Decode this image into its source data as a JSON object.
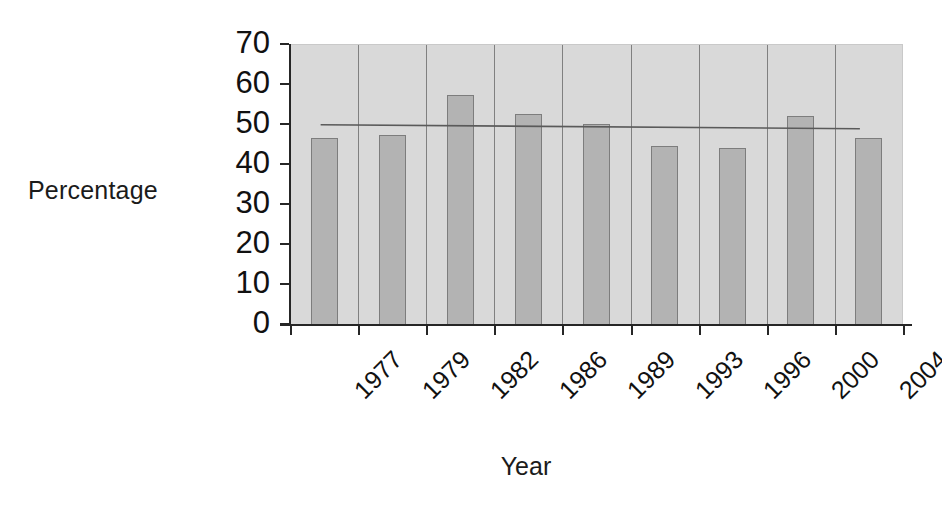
{
  "chart_data": {
    "type": "bar",
    "title": "",
    "subtitle": "",
    "xlabel": "Year",
    "ylabel": "Percentage",
    "categories": [
      "1977",
      "1979",
      "1982",
      "1986",
      "1989",
      "1993",
      "1996",
      "2000",
      "2004"
    ],
    "values": [
      46.5,
      47.3,
      57.3,
      52.5,
      50.0,
      44.6,
      44.0,
      52.0,
      46.6
    ],
    "ylim": [
      0,
      70
    ],
    "yticks": [
      0,
      10,
      20,
      30,
      40,
      50,
      60,
      70
    ],
    "ytick_labels": [
      "0",
      "10",
      "20",
      "30",
      "40",
      "50",
      "60",
      "70"
    ],
    "grid": "vertical-category-separators",
    "legend": "none",
    "legend_position": "none",
    "annotations": [
      {
        "name": "trend-line",
        "type": "line",
        "start_value": 50.0,
        "end_value": 49.0,
        "description": "nearly flat trend line spanning the plot"
      }
    ],
    "series": [
      {
        "name": "Percentage",
        "values": [
          46.5,
          47.3,
          57.3,
          52.5,
          50.0,
          44.6,
          44.0,
          52.0,
          46.6
        ]
      }
    ],
    "colors": {
      "bar_fill": "#b3b3b3",
      "bar_edge": "#7d7d7d",
      "plot_background": "#d9d9d9",
      "grid_line": "#808080",
      "axis": "#262626",
      "trend_line": "#5a5a5a",
      "text": "#111111",
      "figure_background": "#ffffff"
    }
  }
}
